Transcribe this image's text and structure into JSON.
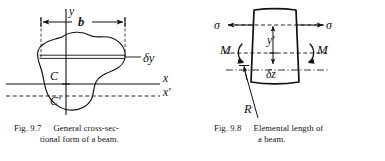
{
  "figures": [
    {
      "id": "fig-9-7",
      "number": "Fig. 9.7",
      "caption_line1": "General  cross-sec-",
      "caption_line2": "tional form of a beam.",
      "caption_full": "Fig. 9.7  General cross-sectional form of a beam.",
      "labels": {
        "y_axis": "y",
        "width_dim": "b",
        "strip_thickness": "δy",
        "centroid": "C",
        "centroid_prime": "C′",
        "x_axis": "x",
        "x_axis_prime": "x′"
      }
    },
    {
      "id": "fig-9-8",
      "number": "Fig. 9.8",
      "caption_line1": "Elemental length of",
      "caption_line2": "a beam.",
      "caption_full": "Fig. 9.8  Elemental length of a beam.",
      "labels": {
        "stress_left": "σ",
        "stress_right": "σ",
        "moment_left": "M",
        "moment_right": "M",
        "distance_from_na": "y′",
        "element_length": "δz",
        "radius_of_curvature": "R"
      }
    }
  ],
  "colors": {
    "ink": "#111111",
    "background": "#ffffff"
  }
}
